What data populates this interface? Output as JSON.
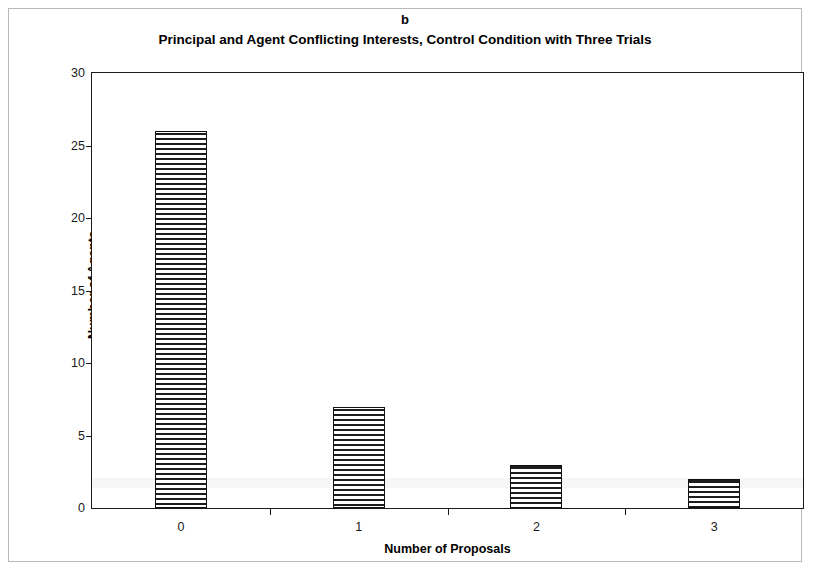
{
  "figure": {
    "panel_letter": "b",
    "title": "Principal and Agent Conflicting Interests, Control Condition with Three Trials"
  },
  "chart_data": {
    "type": "bar",
    "title": "Principal and Agent Conflicting Interests, Control Condition with Three Trials",
    "panel_label": "b",
    "categories": [
      "0",
      "1",
      "2",
      "3"
    ],
    "values": [
      26,
      7,
      3,
      2
    ],
    "xlabel": "Number of Proposals",
    "ylabel": "Number of Agents",
    "ylim": [
      0,
      30
    ],
    "yticks": [
      0,
      5,
      10,
      15,
      20,
      25,
      30
    ],
    "ytick_labels": [
      "0",
      "5",
      "10",
      "15",
      "20",
      "25",
      "30"
    ],
    "grid": false,
    "legend": false,
    "bar_fill": "horizontal-hatch",
    "bar_edge_color": "#111111",
    "axis_color": "#1a1a1a",
    "background": "#ffffff"
  }
}
